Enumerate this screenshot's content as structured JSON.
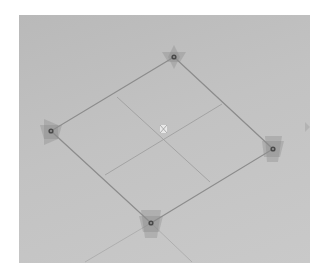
{
  "viewport": {
    "background": "#c0c0c0",
    "edge_color": "#8a8a8a",
    "handle_color": "#4a4a4a",
    "handle_fill": "rgba(140,140,140,0.35)"
  },
  "quad": {
    "vertices": [
      {
        "name": "top",
        "x": 174,
        "y": 57
      },
      {
        "name": "right",
        "x": 273,
        "y": 149
      },
      {
        "name": "bottom",
        "x": 151,
        "y": 223
      },
      {
        "name": "left",
        "x": 51,
        "y": 131
      }
    ],
    "subdivisions": 2,
    "pivot": {
      "x": 163,
      "y": 129,
      "icon": "move-pivot-icon"
    }
  },
  "grid_guides": [
    {
      "x1": 151,
      "y1": 223,
      "x2": 85,
      "y2": 262
    },
    {
      "x1": 151,
      "y1": 223,
      "x2": 192,
      "y2": 262
    }
  ]
}
